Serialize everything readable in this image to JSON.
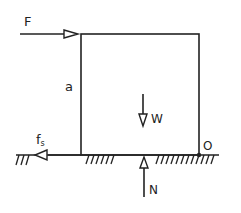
{
  "diagram": {
    "type": "free-body diagram",
    "labels": {
      "applied_force": "F",
      "height": "a",
      "friction_main": "f",
      "friction_sub": "s",
      "weight": "W",
      "normal": "N",
      "pivot": "O"
    },
    "colors": {
      "stroke": "#222222",
      "background": "#ffffff"
    }
  }
}
